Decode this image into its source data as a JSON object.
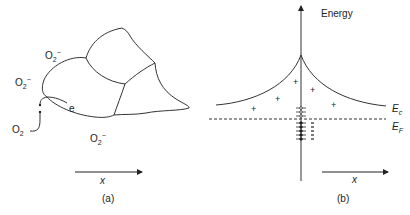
{
  "panel_a": {
    "caption": "(a)",
    "axis_label": "x",
    "species": {
      "o2_minus_top": {
        "base": "O",
        "sub": "2",
        "sup": "−"
      },
      "o2_minus_left": {
        "base": "O",
        "sub": "2",
        "sup": "−"
      },
      "o2_minus_bottom": {
        "base": "O",
        "sub": "2",
        "sup": "−"
      },
      "o2": {
        "base": "O",
        "sub": "2"
      }
    },
    "electron_label": "e"
  },
  "panel_b": {
    "caption": "(b)",
    "axis_label": "x",
    "energy_label": "Energy",
    "ec_label": {
      "base": "E",
      "sub": "c"
    },
    "ef_label": {
      "base": "E",
      "sub": "F"
    },
    "positive_charge_symbol": "+",
    "negative_charge_symbol": "−"
  },
  "colors": {
    "line": "#333333",
    "text": "#222222",
    "background": "#ffffff"
  }
}
